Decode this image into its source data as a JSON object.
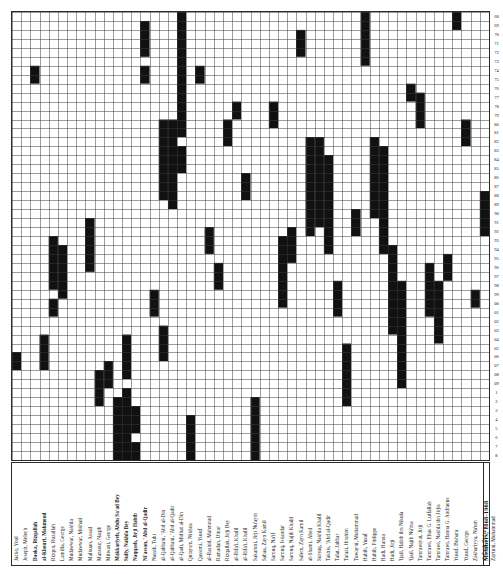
{
  "figure": {
    "title": "Members, 1868-1908",
    "type": "membership-tenure-grid",
    "grid": {
      "columns": 52,
      "rows": 50,
      "cell_px": 9.1,
      "line_color": "#3a3a3a",
      "fill_color": "#111111",
      "background": "#ffffff"
    }
  },
  "column_labels": [
    {
      "text": "Jacko, Youl",
      "bold": false
    },
    {
      "text": "Joseph, Melech",
      "bold": false
    },
    {
      "text": "Daoka, Rizqallah",
      "bold": true
    },
    {
      "text": "al-Khouri, Mahmoud",
      "bold": true
    },
    {
      "text": "Rizqon, Ruzallah",
      "bold": false
    },
    {
      "text": "Lamilla, George",
      "bold": false
    },
    {
      "text": "Mudawwar, Nakhla",
      "bold": false
    },
    {
      "text": "Mudawwar, Mikhail",
      "bold": false
    },
    {
      "text": "Malkuan, Assad",
      "bold": false
    },
    {
      "text": "Mansour, Naqib",
      "bold": false
    },
    {
      "text": "Mitwani, George",
      "bold": false
    },
    {
      "text": "Makkariyeh, Abdu Sa'ad Bey",
      "bold": true
    },
    {
      "text": "Sully, Nakhla Bey",
      "bold": true
    },
    {
      "text": "Naqqash, Jirji Habib",
      "bold": true
    },
    {
      "text": "Ni'assan, 'Abd al-Qadir",
      "bold": true
    },
    {
      "text": "Nassib, Tubi",
      "bold": false
    },
    {
      "text": "al-Qabbani, 'Abd al-Din",
      "bold": false
    },
    {
      "text": "al-Qabbani, 'Abd al-Qadir",
      "bold": false
    },
    {
      "text": "al-Qadi, Midhat al-Din",
      "bold": false
    },
    {
      "text": "Quraysm, Nikhoa",
      "bold": false
    },
    {
      "text": "Qassimi, Yusuf",
      "bold": false
    },
    {
      "text": "al-Rashid, Mahmoud",
      "bold": false
    },
    {
      "text": "Ramadan, Umar",
      "bold": false
    },
    {
      "text": "Rizqallah, Jirji Bey",
      "bold": false
    },
    {
      "text": "al-Rifa'i, Khalil",
      "bold": false
    },
    {
      "text": "al-Rifa'i, Khalil",
      "bold": false
    },
    {
      "text": "Sakaruni, Jirji Nu'aym",
      "bold": false
    },
    {
      "text": "Sabaa, Zayn Kamil",
      "bold": false
    },
    {
      "text": "Sarouq, Na'if",
      "bold": false
    },
    {
      "text": "Sarouq, Iskandar",
      "bold": false
    },
    {
      "text": "Sarouq, Najib Khalil",
      "bold": false
    },
    {
      "text": "Salem, Zayn Kamil",
      "bold": false
    },
    {
      "text": "al-Shami, Abed",
      "bold": false
    },
    {
      "text": "Sursuq, Nakhla Khalil",
      "bold": false
    },
    {
      "text": "Takhis, 'Abd al-Qadir",
      "bold": false
    },
    {
      "text": "Talat, Jabbar",
      "bold": false
    },
    {
      "text": "Tarazi, Ibrahim",
      "bold": false
    },
    {
      "text": "Tuwayni, Muhammad",
      "bold": false
    },
    {
      "text": "Habib, Yusuf",
      "bold": false
    },
    {
      "text": "Habib, Philippe",
      "bold": false
    },
    {
      "text": "Hadi, Hanna",
      "bold": false
    },
    {
      "text": "Hadi, Jirji",
      "bold": false
    },
    {
      "text": "'Ijail, Habib ibn Nikula",
      "bold": false
    },
    {
      "text": "'Ijail, Najib Nu'ma",
      "bold": false
    },
    {
      "text": "Tamrawiyat, Jirji",
      "bold": false
    },
    {
      "text": "Tamrawi, Elias G. Lutfallah",
      "bold": false
    },
    {
      "text": "Tamrawi, Nakhla ibn Jirjis",
      "bold": false
    },
    {
      "text": "Tamrawi, Hanna G. Andraous",
      "bold": false
    },
    {
      "text": "Yusuf, Bishara",
      "bold": false
    },
    {
      "text": "Yusuf, George",
      "bold": false
    },
    {
      "text": "Zakhariyya, Na'um",
      "bold": false
    },
    {
      "text": "al-Zaid, Bishara",
      "bold": false
    },
    {
      "text": "Zaytuni, Muhammad",
      "bold": false
    }
  ],
  "row_numbers": [
    "68",
    "69",
    "70",
    "71",
    "72",
    "73",
    "74",
    "75",
    "76",
    "77",
    "78",
    "79",
    "80",
    "81",
    "82",
    "83",
    "84",
    "85",
    "86",
    "87",
    "88",
    "89",
    "90",
    "91",
    "92",
    "93",
    "94",
    "95",
    "96",
    "97",
    "98",
    "99",
    "00",
    "01",
    "02",
    "03",
    "04",
    "05",
    "06",
    "07",
    "08",
    "09",
    "1",
    "2",
    "3",
    "4",
    "5",
    "6",
    "7",
    "8",
    "9"
  ],
  "chart_data": {
    "type": "heatmap",
    "title": "Members, 1868-1908",
    "xlabel": "",
    "ylabel": "",
    "legend": [],
    "grid_on": true,
    "filled_spans": [
      {
        "col": 0,
        "start": 38,
        "end": 39
      },
      {
        "col": 2,
        "start": 6,
        "end": 7
      },
      {
        "col": 3,
        "start": 36,
        "end": 39
      },
      {
        "col": 4,
        "start": 25,
        "end": 30
      },
      {
        "col": 4,
        "start": 32,
        "end": 33
      },
      {
        "col": 5,
        "start": 26,
        "end": 31
      },
      {
        "col": 8,
        "start": 23,
        "end": 28
      },
      {
        "col": 9,
        "start": 40,
        "end": 43
      },
      {
        "col": 10,
        "start": 39,
        "end": 41
      },
      {
        "col": 11,
        "start": 43,
        "end": 49
      },
      {
        "col": 12,
        "start": 42,
        "end": 49
      },
      {
        "col": 12,
        "start": 36,
        "end": 40
      },
      {
        "col": 13,
        "start": 44,
        "end": 46
      },
      {
        "col": 13,
        "start": 48,
        "end": 49
      },
      {
        "col": 14,
        "start": 1,
        "end": 4
      },
      {
        "col": 14,
        "start": 6,
        "end": 7
      },
      {
        "col": 15,
        "start": 31,
        "end": 33
      },
      {
        "col": 16,
        "start": 12,
        "end": 20
      },
      {
        "col": 16,
        "start": 35,
        "end": 38
      },
      {
        "col": 17,
        "start": 12,
        "end": 21
      },
      {
        "col": 18,
        "start": 0,
        "end": 13
      },
      {
        "col": 18,
        "start": 15,
        "end": 17
      },
      {
        "col": 19,
        "start": 45,
        "end": 49
      },
      {
        "col": 20,
        "start": 6,
        "end": 7
      },
      {
        "col": 21,
        "start": 24,
        "end": 26
      },
      {
        "col": 22,
        "start": 28,
        "end": 30
      },
      {
        "col": 23,
        "start": 12,
        "end": 14
      },
      {
        "col": 24,
        "start": 10,
        "end": 11
      },
      {
        "col": 25,
        "start": 18,
        "end": 20
      },
      {
        "col": 26,
        "start": 43,
        "end": 49
      },
      {
        "col": 28,
        "start": 10,
        "end": 12
      },
      {
        "col": 29,
        "start": 25,
        "end": 32
      },
      {
        "col": 30,
        "start": 24,
        "end": 27
      },
      {
        "col": 31,
        "start": 2,
        "end": 4
      },
      {
        "col": 32,
        "start": 14,
        "end": 24
      },
      {
        "col": 33,
        "start": 14,
        "end": 23
      },
      {
        "col": 34,
        "start": 16,
        "end": 26
      },
      {
        "col": 35,
        "start": 30,
        "end": 33
      },
      {
        "col": 36,
        "start": 37,
        "end": 43
      },
      {
        "col": 37,
        "start": 22,
        "end": 24
      },
      {
        "col": 38,
        "start": 0,
        "end": 5
      },
      {
        "col": 39,
        "start": 14,
        "end": 22
      },
      {
        "col": 40,
        "start": 15,
        "end": 26
      },
      {
        "col": 41,
        "start": 26,
        "end": 35
      },
      {
        "col": 42,
        "start": 30,
        "end": 41
      },
      {
        "col": 43,
        "start": 8,
        "end": 9
      },
      {
        "col": 44,
        "start": 9,
        "end": 12
      },
      {
        "col": 45,
        "start": 28,
        "end": 33
      },
      {
        "col": 46,
        "start": 30,
        "end": 36
      },
      {
        "col": 47,
        "start": 27,
        "end": 29
      },
      {
        "col": 48,
        "start": 0,
        "end": 1
      },
      {
        "col": 49,
        "start": 12,
        "end": 14
      },
      {
        "col": 50,
        "start": 31,
        "end": 32
      },
      {
        "col": 51,
        "start": 20,
        "end": 24
      }
    ]
  }
}
